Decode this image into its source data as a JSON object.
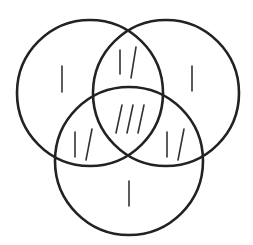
{
  "diagram": {
    "type": "venn",
    "sets": [
      {
        "id": "A",
        "position": "top-left",
        "cx": 90,
        "cy": 93,
        "r": 73
      },
      {
        "id": "B",
        "position": "top-right",
        "cx": 166,
        "cy": 93,
        "r": 73
      },
      {
        "id": "C",
        "position": "bottom",
        "cx": 129,
        "cy": 161,
        "r": 74
      }
    ],
    "stroke_color": "#222222",
    "regions": [
      {
        "name": "A only",
        "tally": "|",
        "count": 1
      },
      {
        "name": "B only",
        "tally": "|",
        "count": 1
      },
      {
        "name": "C only",
        "tally": "|",
        "count": 1
      },
      {
        "name": "A and B only",
        "tally": "|/",
        "count": 2
      },
      {
        "name": "A and C only",
        "tally": "|/",
        "count": 2
      },
      {
        "name": "B and C only",
        "tally": "|/",
        "count": 2
      },
      {
        "name": "A and B and C",
        "tally": "///",
        "count": 3
      }
    ]
  }
}
